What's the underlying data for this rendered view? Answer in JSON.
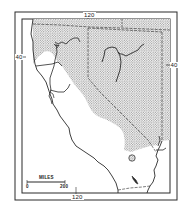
{
  "map": {
    "type": "reference map",
    "region_description": "California and Nevada with stippled region",
    "colors": {
      "ink": "#2a2a2a",
      "stipple": "#9a9a9a",
      "background": "#ffffff"
    },
    "graticule_labels": {
      "top_longitude": "120",
      "bottom_longitude": "120",
      "left_latitude": "40",
      "right_latitude": "40"
    },
    "scale_bar": {
      "title": "MILES",
      "start": "0",
      "end": "200"
    },
    "legend": {
      "shaded_area": "stippled region"
    }
  }
}
